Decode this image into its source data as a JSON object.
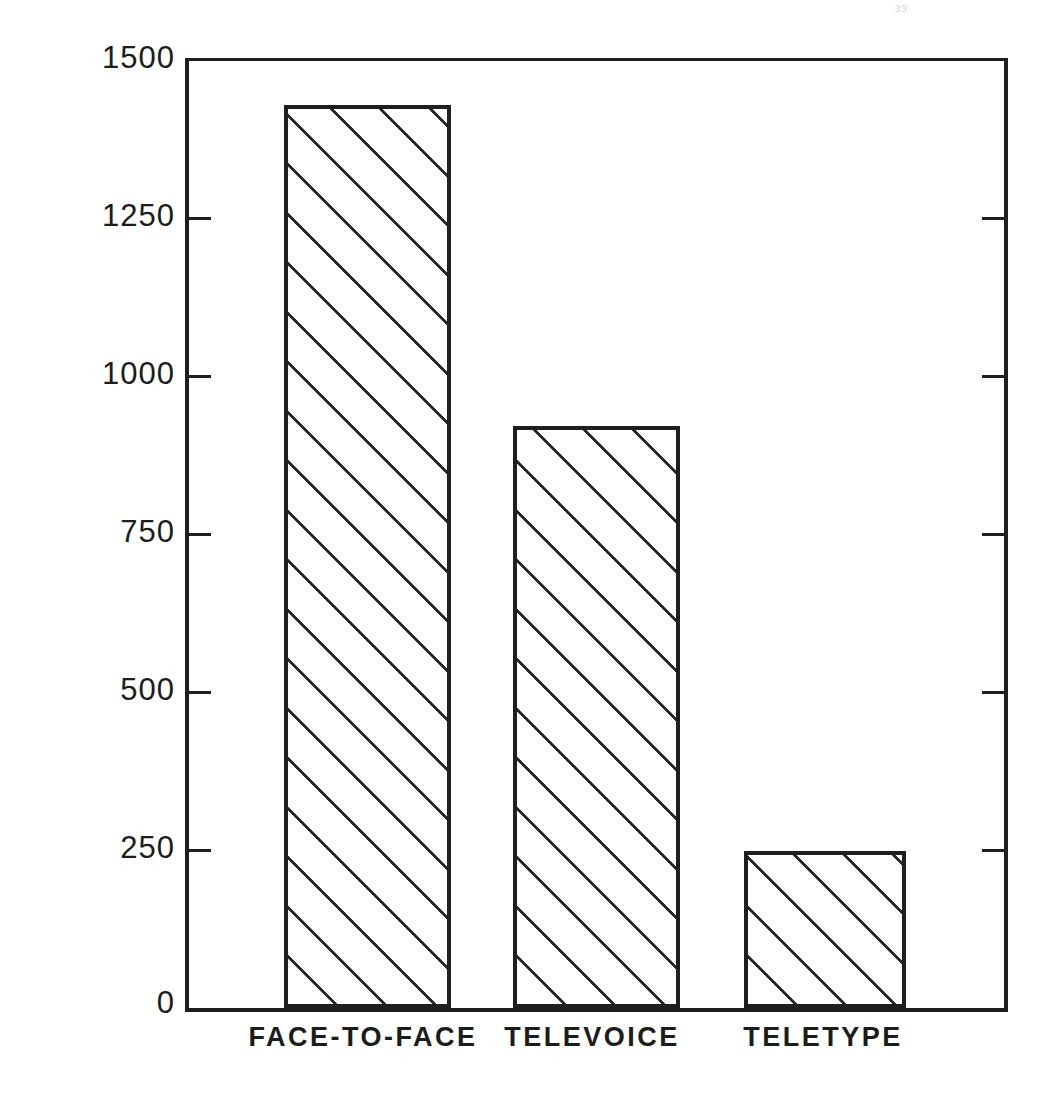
{
  "page": {
    "artifact_mark": "39"
  },
  "chart_data": {
    "type": "bar",
    "title": "",
    "xlabel": "",
    "ylabel": "MEAN NUMBER OF WORDS PER PERSON",
    "categories": [
      "FACE-TO-FACE",
      "TELEVOICE",
      "TELETYPE"
    ],
    "values": [
      1430,
      922,
      248
    ],
    "ylim": [
      0,
      1500
    ],
    "yticks": [
      0,
      250,
      500,
      750,
      1000,
      1250,
      1500
    ],
    "ytick_labels": [
      "0",
      "250",
      "500",
      "750",
      "1000",
      "1250",
      "1500"
    ],
    "grid": false,
    "legend": null,
    "bar_fill": "diagonal-hatch",
    "colors": {
      "line": "#1f1f1f",
      "hatch": "#2a2a2a",
      "background": "#ffffff"
    }
  }
}
